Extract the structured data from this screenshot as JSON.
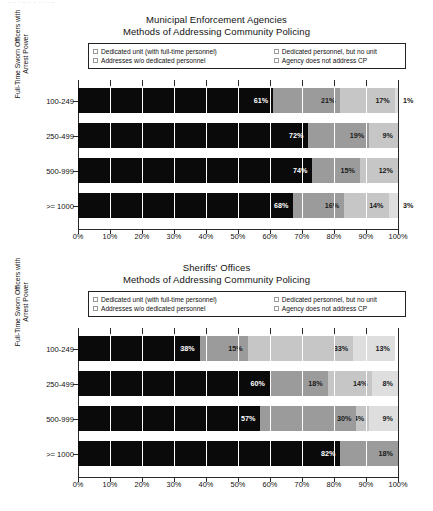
{
  "scan_artifact": "· - -- · -- - ·· - · - --",
  "colors": {
    "series_0": "#0a0a0a",
    "series_1": "#9b9b9b",
    "series_2": "#c6c6c6",
    "series_3": "#dedede",
    "axis": "#2a2a2a",
    "background": "#ffffff"
  },
  "legend": {
    "items": [
      {
        "label": "Dedicated unit (with full-time personnel)",
        "swatch": "series_0"
      },
      {
        "label": "Dedicated personnel, but no unit",
        "swatch": "series_1"
      },
      {
        "label": "Addresses w/o dedicated personnel",
        "swatch": "series_2"
      },
      {
        "label": "Agency does not address CP",
        "swatch": "series_3"
      }
    ]
  },
  "axis": {
    "y_label_line1": "Full-Time Sworn Officers with",
    "y_label_line2": "Arrest Power",
    "x_ticks": [
      "0%",
      "10%",
      "20%",
      "30%",
      "40%",
      "50%",
      "60%",
      "70%",
      "80%",
      "90%",
      "100%"
    ]
  },
  "charts": [
    {
      "title_line1": "Municipal Enforcement Agencies",
      "title_line2": "Methods of Addressing Community Policing",
      "categories": [
        "100-249",
        "250-499",
        "500-999",
        ">= 1000"
      ],
      "rows": [
        {
          "category": "100-249",
          "values": [
            61,
            21,
            17,
            1
          ],
          "labels": [
            "61%",
            "21%",
            "17%",
            "1%"
          ],
          "label_outside": [
            false,
            false,
            false,
            true
          ]
        },
        {
          "category": "250-499",
          "values": [
            72,
            19,
            9,
            0
          ],
          "labels": [
            "72%",
            "19%",
            "9%",
            ""
          ],
          "label_outside": [
            false,
            false,
            false,
            false
          ]
        },
        {
          "category": "500-999",
          "values": [
            74,
            15,
            12,
            0
          ],
          "labels": [
            "74%",
            "15%",
            "12%",
            ""
          ],
          "label_outside": [
            false,
            false,
            false,
            false
          ]
        },
        {
          "category": ">= 1000",
          "values": [
            68,
            16,
            14,
            3
          ],
          "labels": [
            "68%",
            "16%",
            "14%",
            "3%"
          ],
          "label_outside": [
            false,
            false,
            false,
            true
          ]
        }
      ]
    },
    {
      "title_line1": "Sheriffs' Offices",
      "title_line2": "Methods of Addressing Community Policing",
      "categories": [
        "100-249",
        "250-499",
        "500-999",
        ">= 1000"
      ],
      "rows": [
        {
          "category": "100-249",
          "values": [
            38,
            15,
            33,
            13
          ],
          "labels": [
            "38%",
            "15%",
            "33%",
            "13%"
          ],
          "label_outside": [
            false,
            false,
            false,
            false
          ]
        },
        {
          "category": "250-499",
          "values": [
            60,
            18,
            14,
            8
          ],
          "labels": [
            "60%",
            "18%",
            "14%",
            "8%"
          ],
          "label_outside": [
            false,
            false,
            false,
            false
          ]
        },
        {
          "category": "500-999",
          "values": [
            57,
            30,
            4,
            9
          ],
          "labels": [
            "57%",
            "30%",
            "4%",
            "9%"
          ],
          "label_outside": [
            false,
            false,
            false,
            false
          ]
        },
        {
          "category": ">= 1000",
          "values": [
            82,
            18,
            0,
            0
          ],
          "labels": [
            "82%",
            "18%",
            "",
            ""
          ],
          "label_outside": [
            false,
            false,
            false,
            false
          ]
        }
      ]
    }
  ],
  "chart_data": [
    {
      "type": "bar",
      "orientation": "horizontal",
      "stacked": true,
      "normalized": true,
      "title": "Municipal Enforcement Agencies — Methods of Addressing Community Policing",
      "xlabel": "",
      "ylabel": "Full-Time Sworn Officers with Arrest Power",
      "xlim": [
        0,
        100
      ],
      "xticks": [
        0,
        10,
        20,
        30,
        40,
        50,
        60,
        70,
        80,
        90,
        100
      ],
      "grid": true,
      "legend_position": "top",
      "categories": [
        "100-249",
        "250-499",
        "500-999",
        ">= 1000"
      ],
      "series": [
        {
          "name": "Dedicated unit (with full-time personnel)",
          "values": [
            61,
            72,
            74,
            68
          ],
          "color": "#0a0a0a"
        },
        {
          "name": "Dedicated personnel, but no unit",
          "values": [
            21,
            19,
            15,
            16
          ],
          "color": "#9b9b9b"
        },
        {
          "name": "Addresses w/o dedicated personnel",
          "values": [
            17,
            9,
            12,
            14
          ],
          "color": "#c6c6c6"
        },
        {
          "name": "Agency does not address CP",
          "values": [
            1,
            0,
            0,
            3
          ],
          "color": "#dedede"
        }
      ]
    },
    {
      "type": "bar",
      "orientation": "horizontal",
      "stacked": true,
      "normalized": true,
      "title": "Sheriffs' Offices — Methods of Addressing Community Policing",
      "xlabel": "",
      "ylabel": "Full-Time Sworn Officers with Arrest Power",
      "xlim": [
        0,
        100
      ],
      "xticks": [
        0,
        10,
        20,
        30,
        40,
        50,
        60,
        70,
        80,
        90,
        100
      ],
      "grid": true,
      "legend_position": "top",
      "categories": [
        "100-249",
        "250-499",
        "500-999",
        ">= 1000"
      ],
      "series": [
        {
          "name": "Dedicated unit (with full-time personnel)",
          "values": [
            38,
            60,
            57,
            82
          ],
          "color": "#0a0a0a"
        },
        {
          "name": "Dedicated personnel, but no unit",
          "values": [
            15,
            18,
            30,
            18
          ],
          "color": "#9b9b9b"
        },
        {
          "name": "Addresses w/o dedicated personnel",
          "values": [
            33,
            14,
            4,
            0
          ],
          "color": "#c6c6c6"
        },
        {
          "name": "Agency does not address CP",
          "values": [
            13,
            8,
            9,
            0
          ],
          "color": "#dedede"
        }
      ]
    }
  ]
}
